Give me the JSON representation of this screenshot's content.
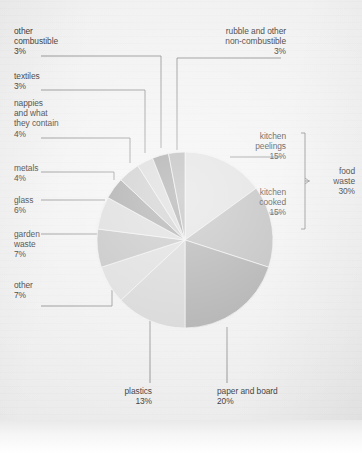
{
  "chart_data": {
    "type": "pie",
    "title": "",
    "subtitle": "",
    "xlabel": "",
    "ylabel": "",
    "legend_position": "callout-labels",
    "grid": false,
    "units": "percent",
    "total": 100,
    "start_angle_deg": 0,
    "direction": "clockwise",
    "categories": [
      "kitchen peelings",
      "kitchen cooked",
      "paper and board",
      "plastics",
      "other",
      "garden waste",
      "glass",
      "metals",
      "nappies and what they contain",
      "textiles",
      "other combustible",
      "rubble and other non-combustible"
    ],
    "values": [
      15,
      15,
      20,
      13,
      7,
      7,
      6,
      4,
      4,
      3,
      3,
      3
    ],
    "slice_colors": [
      "#d9d9d9",
      "#aeaeae",
      "#9a9a9a",
      "#cccccc",
      "#d4d4d4",
      "#b4b4b4",
      "#d2d2d2",
      "#8f8f8f",
      "#bdbdbd",
      "#cfcfcf",
      "#8a8a8a",
      "#a4a4a4"
    ],
    "groups": [
      {
        "label": "food waste",
        "value": 30,
        "members": [
          "kitchen peelings",
          "kitchen cooked"
        ]
      }
    ],
    "annotations": [
      "food waste 30% bracket groups kitchen peelings and kitchen cooked"
    ]
  },
  "labels": {
    "other_combustible": {
      "name": "other\ncombustible",
      "pct": "3%"
    },
    "textiles": {
      "name": "textiles",
      "pct": "3%"
    },
    "nappies": {
      "name": "nappies\nand what\nthey contain",
      "pct": "4%"
    },
    "metals": {
      "name": "metals",
      "pct": "4%"
    },
    "glass": {
      "name": "glass",
      "pct": "6%"
    },
    "garden_waste": {
      "name": "garden\nwaste",
      "pct": "7%"
    },
    "other": {
      "name": "other",
      "pct": "7%"
    },
    "rubble": {
      "name": "rubble and other\nnon-combustible",
      "pct": "3%"
    },
    "kitchen_peelings": {
      "name": "kitchen\npeelings",
      "pct": "15%"
    },
    "kitchen_cooked": {
      "name": "kitchen\ncooked",
      "pct": "15%"
    },
    "food_waste": {
      "name": "food\nwaste",
      "pct": "30%"
    },
    "plastics": {
      "name": "plastics",
      "pct": "13%"
    },
    "paper_and_board": {
      "name": "paper and board",
      "pct": "20%"
    }
  },
  "colors": {
    "text": "#1c1c1c",
    "leader_line": "#6f6f6f",
    "paper": "#eeeeee"
  }
}
